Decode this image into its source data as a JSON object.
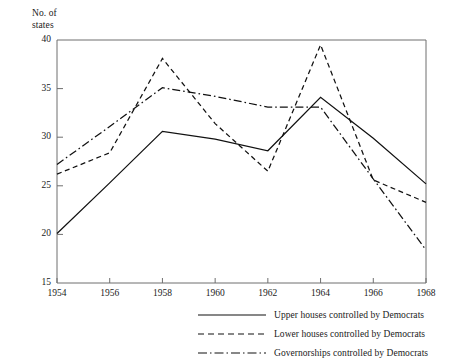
{
  "chart_data": {
    "type": "line",
    "title": "",
    "ylabel": "No. of\nstates",
    "xlabel": "",
    "x": [
      1954,
      1956,
      1958,
      1960,
      1962,
      1964,
      1966,
      1968
    ],
    "xtick_labels": [
      "1954",
      "1956",
      "1958",
      "1960",
      "1962",
      "1964",
      "1966",
      "1968"
    ],
    "ytick_labels": [
      "40",
      "35",
      "30",
      "25",
      "20",
      "15"
    ],
    "ytick_values": [
      40,
      35,
      30,
      25,
      20,
      15
    ],
    "ylim": [
      15,
      40
    ],
    "xlim": [
      1954,
      1968
    ],
    "grid": false,
    "legend_position": "below-right",
    "series": [
      {
        "name": "Upper houses controlled by Democrats",
        "style": "solid",
        "color": "#111111",
        "values": [
          20.1,
          25.3,
          30.6,
          29.8,
          28.6,
          34.1,
          29.9,
          25.2
        ]
      },
      {
        "name": "Lower houses controlled by Democrats",
        "style": "dashed",
        "color": "#111111",
        "values": [
          26.2,
          28.4,
          38.1,
          31.4,
          26.5,
          39.5,
          25.6,
          23.3
        ]
      },
      {
        "name": "Governorships controlled by Democrats",
        "style": "dashdot",
        "color": "#111111",
        "values": [
          27.2,
          31.1,
          35.1,
          34.2,
          33.1,
          33.1,
          25.7,
          18.4
        ]
      }
    ]
  },
  "axis": {
    "y_title": "No. of\nstates"
  },
  "legend": {
    "items": [
      {
        "label": "Upper houses controlled by Democrats",
        "style": "solid"
      },
      {
        "label": "Lower houses controlled by Democrats",
        "style": "dashed"
      },
      {
        "label": "Governorships controlled by Democrats",
        "style": "dashdot"
      }
    ]
  }
}
